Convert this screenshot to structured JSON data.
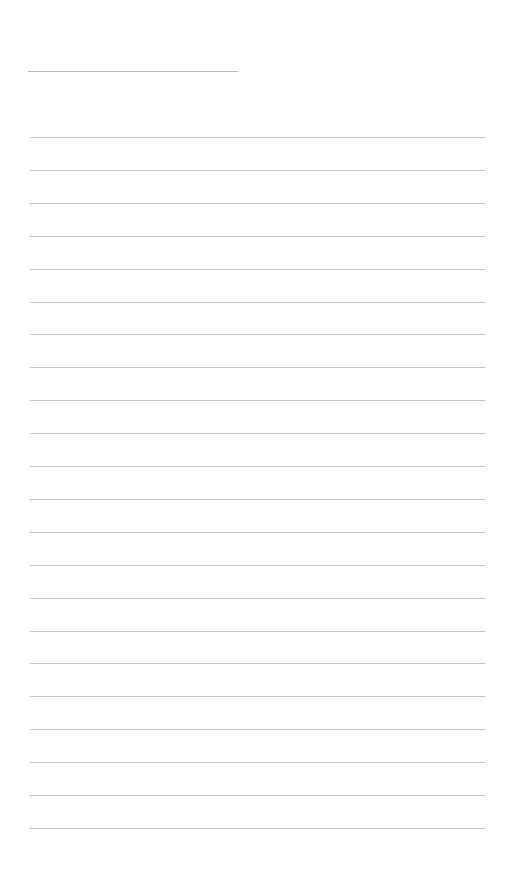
{
  "page": {
    "type": "lined-writing-page",
    "background": "#ffffff",
    "line_color": "#c4c4c4"
  },
  "title_line": {
    "label": ""
  },
  "ruled_lines": {
    "count": 22,
    "first_y": 137,
    "spacing": 32.9
  },
  "footer": {
    "text": ""
  }
}
